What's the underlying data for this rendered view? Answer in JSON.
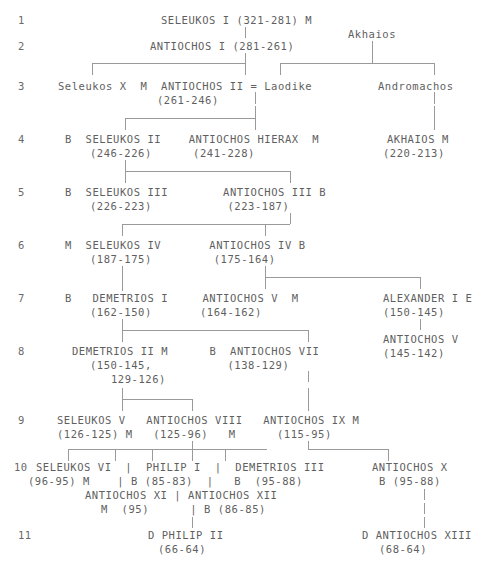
{
  "chart": {
    "type": "genealogy-tree",
    "text_color": "#5f5f5f",
    "line_color": "#9a9a9a",
    "background": "#ffffff"
  },
  "row_numbers": [
    "1",
    "2",
    "3",
    "4",
    "5",
    "6",
    "7",
    "8",
    "9",
    "10",
    "11"
  ],
  "generations": [
    {
      "row": "1",
      "entries": [
        {
          "name": "SELEUKOS I",
          "dates": "(321-281)",
          "suffix": "M",
          "full": "SELEUKOS I (321-281) M"
        }
      ]
    },
    {
      "row": "2",
      "entries": [
        {
          "name": "ANTIOCHOS I",
          "dates": "(281-261)",
          "full": "ANTIOCHOS I (281-261)"
        },
        {
          "name": "Akhaios",
          "full": "Akhaios"
        }
      ]
    },
    {
      "row": "3",
      "entries": [
        {
          "name": "Seleukos X",
          "suffix": "M",
          "full": "Seleukos X  M"
        },
        {
          "name": "ANTIOCHOS II",
          "dates": "(261-246)",
          "spouse": "Laodike",
          "full": "ANTIOCHOS II = Laodike"
        },
        {
          "name": "Andromachos",
          "full": "Andromachos"
        }
      ]
    },
    {
      "row": "4",
      "entries": [
        {
          "prefix": "B",
          "name": "SELEUKOS II",
          "dates": "(246-226)",
          "full": "B  SELEUKOS II"
        },
        {
          "name": "ANTIOCHOS HIERAX",
          "dates": "(241-228)",
          "suffix": "M",
          "full": "ANTIOCHOS HIERAX  M"
        },
        {
          "name": "AKHAIOS",
          "dates": "(220-213)",
          "suffix": "M",
          "full": "AKHAIOS M"
        }
      ]
    },
    {
      "row": "5",
      "entries": [
        {
          "prefix": "B",
          "name": "SELEUKOS III",
          "dates": "(226-223)",
          "full": "B  SELEUKOS III"
        },
        {
          "name": "ANTIOCHOS III",
          "dates": "(223-187)",
          "suffix": "B",
          "full": "ANTIOCHOS III B"
        }
      ]
    },
    {
      "row": "6",
      "entries": [
        {
          "prefix": "M",
          "name": "SELEUKOS IV",
          "dates": "(187-175)",
          "full": "M  SELEUKOS IV"
        },
        {
          "name": "ANTIOCHOS IV",
          "dates": "(175-164)",
          "suffix": "B",
          "full": "ANTIOCHOS IV B"
        }
      ]
    },
    {
      "row": "7",
      "entries": [
        {
          "prefix": "B",
          "name": "DEMETRIOS I",
          "dates": "(162-150)",
          "full": "B   DEMETRIOS I"
        },
        {
          "name": "ANTIOCHOS V",
          "dates": "(164-162)",
          "suffix": "M",
          "full": "ANTIOCHOS V  M"
        },
        {
          "name": "ALEXANDER I",
          "dates": "(150-145)",
          "suffix": "E",
          "full": "ALEXANDER I E"
        }
      ]
    },
    {
      "row": "8",
      "entries": [
        {
          "name": "DEMETRIOS II",
          "dates": "(150-145, 129-126)",
          "suffix": "M",
          "full": "DEMETRIOS II M"
        },
        {
          "prefix": "B",
          "name": "ANTIOCHOS VII",
          "dates": "(138-129)",
          "full": "B  ANTIOCHOS VII"
        },
        {
          "name": "ANTIOCHOS V",
          "dates": "(145-142)",
          "full": "ANTIOCHOS V"
        }
      ]
    },
    {
      "row": "9",
      "entries": [
        {
          "name": "SELEUKOS V",
          "dates": "(126-125)",
          "suffix": "M",
          "full": "SELEUKOS V"
        },
        {
          "name": "ANTIOCHOS VIII",
          "dates": "(125-96)",
          "suffix": "M",
          "full": "ANTIOCHOS VIII"
        },
        {
          "name": "ANTIOCHOS IX",
          "dates": "(115-95)",
          "suffix": "M",
          "full": "ANTIOCHOS IX M"
        }
      ]
    },
    {
      "row": "10",
      "entries": [
        {
          "name": "SELEUKOS VI",
          "dates": "(96-95)",
          "suffix": "M",
          "full": "SELEUKOS VI"
        },
        {
          "name": "PHILIP I",
          "prefix": "B",
          "dates": "(85-83)",
          "full": "PHILIP I"
        },
        {
          "name": "DEMETRIOS III",
          "prefix": "B",
          "dates": "(95-88)",
          "full": "DEMETRIOS III"
        },
        {
          "name": "ANTIOCHOS X",
          "prefix": "B",
          "dates": "(95-88)",
          "full": "ANTIOCHOS X"
        },
        {
          "name": "ANTIOCHOS XI",
          "dates": "(95)",
          "suffix": "M",
          "full": "ANTIOCHOS XI"
        },
        {
          "name": "ANTIOCHOS XII",
          "prefix": "B",
          "dates": "(86-85)",
          "full": "ANTIOCHOS XII"
        }
      ]
    },
    {
      "row": "11",
      "entries": [
        {
          "prefix": "D",
          "name": "PHILIP II",
          "dates": "(66-64)",
          "full": "D PHILIP II"
        },
        {
          "prefix": "D",
          "name": "ANTIOCHOS XIII",
          "dates": "(68-64)",
          "full": "D ANTIOCHOS XIII"
        }
      ]
    }
  ],
  "lines": {
    "r1": "SELEUKOS I (321-281) M",
    "r2a": "ANTIOCHOS I (281-261)",
    "r2b": "Akhaios",
    "r3a": "Seleukos X  M  ANTIOCHOS II = Laodike",
    "r3b": "Andromachos",
    "r3c": "(261-246)",
    "r4a": "B  SELEUKOS II    ANTIOCHOS HIERAX  M",
    "r4b": "AKHAIOS M",
    "r4c": "(246-226)      (241-228)",
    "r4d": "(220-213)",
    "r5a": "B  SELEUKOS III        ANTIOCHOS III B",
    "r5b": "(226-223)           (223-187)",
    "r6a": "M  SELEUKOS IV       ANTIOCHOS IV B",
    "r6b": "(187-175)         (175-164)",
    "r7a": "B   DEMETRIOS I     ANTIOCHOS V  M",
    "r7b": "ALEXANDER I E",
    "r7c": "(162-150)       (164-162)",
    "r7d": "(150-145)",
    "r7e": "ANTIOCHOS V",
    "r8a": "DEMETRIOS II M      B  ANTIOCHOS VII",
    "r8b": "(145-142)",
    "r8c": "(150-145,           (138-129)",
    "r8d": "129-126)",
    "r9a": "SELEUKOS V   ANTIOCHOS VIII   ANTIOCHOS IX M",
    "r9b": "(126-125) M   (125-96)   M      (115-95)",
    "r10a": "SELEUKOS VI  |  PHILIP I  |  DEMETRIOS III",
    "r10b": "ANTIOCHOS X",
    "r10c": "(96-95) M    | B (85-83)  |   B  (95-88)",
    "r10d": "B (95-88)",
    "r10e": "ANTIOCHOS XI | ANTIOCHOS XII",
    "r10f": "M  (95)      | B (86-85)",
    "r11a": "D PHILIP II",
    "r11b": "(66-64)",
    "r11c": "D ANTIOCHOS XIII",
    "r11d": "(68-64)"
  },
  "legend_codes": {
    "M": "murdered",
    "B": "battle",
    "D": "died",
    "E": "executed"
  }
}
